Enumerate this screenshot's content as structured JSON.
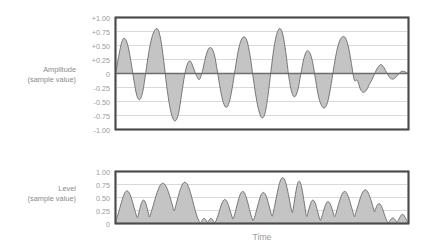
{
  "figure": {
    "xlabel": "Time",
    "charts": [
      {
        "id": "amplitude",
        "label_line1": "Amplitude",
        "label_line2": "(sample value)",
        "ticks": [
          "+1.00",
          "+0.75",
          "+0.50",
          "+0.25",
          "0",
          "-0.25",
          "-0.50",
          "-0.75",
          "-1.00"
        ]
      },
      {
        "id": "level",
        "label_line1": "Level",
        "label_line2": "(sample value)",
        "ticks": [
          "1.00",
          "0.75",
          "0.50",
          "0.25",
          "0"
        ]
      }
    ]
  },
  "colors": {
    "wave_fill": "#c4c4c4",
    "wave_stroke": "#6b6b6b",
    "grid": "#c9c9c9",
    "frame": "#4a4a4a",
    "zero_line": "#6d6d6d",
    "text": "#9a9a9a",
    "background": "#ffffff"
  },
  "chart_data": [
    {
      "type": "area",
      "id": "amplitude",
      "title": "",
      "xlabel": "Time",
      "ylabel": "Amplitude (sample value)",
      "ylim": [
        -1.0,
        1.0
      ],
      "yticks": [
        1.0,
        0.75,
        0.5,
        0.25,
        0,
        -0.25,
        -0.5,
        -0.75,
        -1.0
      ],
      "ytick_labels": [
        "+1.00",
        "+0.75",
        "+0.50",
        "+0.25",
        "0",
        "-0.25",
        "-0.50",
        "-0.75",
        "-1.00"
      ],
      "xlim": [
        0,
        100
      ],
      "grid": true,
      "legend": null,
      "x": [
        0,
        1.2,
        2.5,
        3.8,
        5.0,
        6.2,
        7.5,
        8.8,
        10.0,
        11.2,
        12.5,
        13.8,
        15.0,
        16.2,
        17.5,
        18.8,
        20.0,
        21.2,
        22.5,
        23.8,
        25.0,
        26.2,
        27.5,
        28.8,
        30.0,
        31.2,
        32.5,
        33.8,
        35.0,
        36.2,
        37.5,
        38.8,
        40.0,
        41.2,
        42.5,
        43.8,
        45.0,
        46.2,
        47.5,
        48.8,
        50.0,
        51.2,
        52.5,
        53.8,
        55.0,
        56.2,
        57.5,
        58.8,
        60.0,
        61.2,
        62.5,
        63.8,
        65.0,
        66.2,
        67.5,
        68.8,
        70.0,
        71.2,
        72.5,
        73.8,
        75.0,
        76.2,
        77.5,
        78.8,
        80.0,
        81.2,
        82.5,
        83.8,
        85.0,
        86.2,
        87.5,
        88.8,
        90.0,
        91.2,
        92.5,
        93.8,
        95.0,
        96.2,
        97.5,
        98.8,
        100.0
      ],
      "y": [
        0.04,
        0.34,
        0.58,
        0.63,
        0.5,
        0.22,
        -0.12,
        -0.4,
        -0.47,
        -0.32,
        0.02,
        0.38,
        0.64,
        0.78,
        0.8,
        0.62,
        0.24,
        -0.22,
        -0.58,
        -0.8,
        -0.85,
        -0.72,
        -0.38,
        -0.04,
        0.18,
        0.22,
        0.1,
        -0.04,
        -0.11,
        0.04,
        0.28,
        0.44,
        0.46,
        0.34,
        0.05,
        -0.28,
        -0.52,
        -0.61,
        -0.52,
        -0.26,
        0.08,
        0.4,
        0.6,
        0.66,
        0.58,
        0.32,
        -0.06,
        -0.42,
        -0.68,
        -0.8,
        -0.72,
        -0.4,
        0.04,
        0.46,
        0.72,
        0.81,
        0.7,
        0.38,
        -0.06,
        -0.34,
        -0.42,
        -0.3,
        -0.02,
        0.26,
        0.4,
        0.38,
        0.2,
        -0.12,
        -0.42,
        -0.58,
        -0.62,
        -0.52,
        -0.26,
        0.08,
        0.38,
        0.58,
        0.66,
        0.64,
        0.48,
        0.18,
        -0.12
      ],
      "y_tail": [
        -0.12,
        -0.28,
        -0.34,
        -0.3,
        -0.2,
        -0.1,
        0.02,
        0.12,
        0.16,
        0.1,
        0.0,
        -0.08,
        -0.1,
        -0.06,
        0.0,
        0.04,
        0.03,
        0.0
      ]
    },
    {
      "type": "area",
      "id": "level",
      "title": "",
      "xlabel": "Time",
      "ylabel": "Level (sample value)",
      "ylim": [
        0,
        1.0
      ],
      "yticks": [
        1.0,
        0.75,
        0.5,
        0.25,
        0
      ],
      "ytick_labels": [
        "1.00",
        "0.75",
        "0.50",
        "0.25",
        "0"
      ],
      "xlim": [
        0,
        100
      ],
      "grid": true,
      "legend": null,
      "peaks": [
        {
          "center": 4.0,
          "height": 0.63,
          "width": 5.0
        },
        {
          "center": 10.0,
          "height": 0.45,
          "width": 3.2
        },
        {
          "center": 17.0,
          "height": 0.78,
          "width": 6.5
        },
        {
          "center": 25.0,
          "height": 0.8,
          "width": 6.0
        },
        {
          "center": 32.0,
          "height": 0.09,
          "width": 1.6
        },
        {
          "center": 34.5,
          "height": 0.09,
          "width": 1.6
        },
        {
          "center": 39.5,
          "height": 0.46,
          "width": 4.0
        },
        {
          "center": 46.0,
          "height": 0.62,
          "width": 4.5
        },
        {
          "center": 53.5,
          "height": 0.6,
          "width": 4.5
        },
        {
          "center": 60.5,
          "height": 0.89,
          "width": 5.0
        },
        {
          "center": 66.5,
          "height": 0.82,
          "width": 3.6
        },
        {
          "center": 71.5,
          "height": 0.45,
          "width": 3.4
        },
        {
          "center": 77.0,
          "height": 0.42,
          "width": 3.6
        },
        {
          "center": 83.0,
          "height": 0.62,
          "width": 5.0
        },
        {
          "center": 90.5,
          "height": 0.65,
          "width": 5.5
        },
        {
          "center": 95.5,
          "height": 0.38,
          "width": 3.6
        },
        {
          "center": 100.5,
          "height": 0.1,
          "width": 2.0
        },
        {
          "center": 104.0,
          "height": 0.17,
          "width": 2.4
        }
      ]
    }
  ]
}
